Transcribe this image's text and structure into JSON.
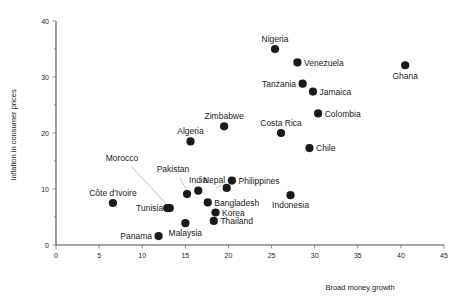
{
  "chart_data": {
    "type": "scatter",
    "title": "",
    "xlabel": "Broad money growth",
    "ylabel": "Inflation in consumer prices",
    "xlim": [
      0,
      45
    ],
    "ylim": [
      0,
      40
    ],
    "xticks": [
      0,
      5,
      10,
      15,
      20,
      25,
      30,
      35,
      40,
      45
    ],
    "yticks": [
      0,
      10,
      20,
      30,
      40
    ],
    "xtick_labels": [
      "0",
      "5",
      "10",
      "15",
      "20",
      "25",
      "30",
      "35",
      "40",
      "45"
    ],
    "ytick_labels": [
      "0",
      "10",
      "20",
      "30",
      "40"
    ],
    "grid": false,
    "legend": "none",
    "marker_color": "#1a1a1a",
    "points": [
      {
        "label": "Nigeria",
        "x": 25.4,
        "y": 35.0,
        "label_pos": "above"
      },
      {
        "label": "Venezuela",
        "x": 28.0,
        "y": 32.6,
        "label_pos": "right"
      },
      {
        "label": "Ghana",
        "x": 40.5,
        "y": 32.1,
        "label_pos": "below"
      },
      {
        "label": "Tanzania",
        "x": 28.6,
        "y": 28.8,
        "label_pos": "left"
      },
      {
        "label": "Jamaica",
        "x": 29.8,
        "y": 27.4,
        "label_pos": "right"
      },
      {
        "label": "Colombia",
        "x": 30.4,
        "y": 23.5,
        "label_pos": "right"
      },
      {
        "label": "Zimbabwe",
        "x": 19.5,
        "y": 21.2,
        "label_pos": "above"
      },
      {
        "label": "Costa Rica",
        "x": 26.1,
        "y": 20.0,
        "label_pos": "above"
      },
      {
        "label": "Algeria",
        "x": 15.6,
        "y": 18.5,
        "label_pos": "above"
      },
      {
        "label": "Chile",
        "x": 29.4,
        "y": 17.3,
        "label_pos": "right"
      },
      {
        "label": "Philippines",
        "x": 20.4,
        "y": 11.5,
        "label_pos": "right"
      },
      {
        "label": "Nepal",
        "x": 19.8,
        "y": 10.2,
        "label_pos": "leader"
      },
      {
        "label": "India",
        "x": 16.5,
        "y": 9.7,
        "label_pos": "above"
      },
      {
        "label": "Indonesia",
        "x": 27.2,
        "y": 8.9,
        "label_pos": "below"
      },
      {
        "label": "Pakistan",
        "x": 15.2,
        "y": 9.1,
        "label_pos": "leader"
      },
      {
        "label": "Côte d'Ivoire",
        "x": 6.6,
        "y": 7.5,
        "label_pos": "above"
      },
      {
        "label": "Bangladesh",
        "x": 17.6,
        "y": 7.6,
        "label_pos": "right"
      },
      {
        "label": "Morocco",
        "x": 12.9,
        "y": 6.6,
        "label_pos": "leader"
      },
      {
        "label": "Tunisia",
        "x": 13.2,
        "y": 6.6,
        "label_pos": "left"
      },
      {
        "label": "Korea",
        "x": 18.5,
        "y": 5.8,
        "label_pos": "right"
      },
      {
        "label": "Thailand",
        "x": 18.3,
        "y": 4.3,
        "label_pos": "right"
      },
      {
        "label": "Malaysia",
        "x": 15.0,
        "y": 3.9,
        "label_pos": "below"
      },
      {
        "label": "Panama",
        "x": 11.9,
        "y": 1.6,
        "label_pos": "left"
      }
    ]
  },
  "axes": {
    "x_title": "Broad money growth",
    "y_title": "Inflation in consumer prices"
  }
}
